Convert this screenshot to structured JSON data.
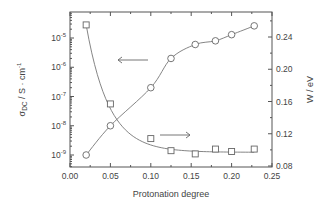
{
  "chart_data": {
    "type": "scatter",
    "title": "",
    "xlabel": "Protonation degree",
    "ylabel_left": "σDC / S · cm⁻¹",
    "ylabel_right": "W / eV",
    "xlim": [
      0.0,
      0.25
    ],
    "ylim_left_log10": [
      -9.5,
      0.8
    ],
    "ylim_right": [
      0.08,
      0.275
    ],
    "x_ticks": [
      "0.00",
      "0.05",
      "0.10",
      "0.15",
      "0.20",
      "0.25"
    ],
    "y_left_ticks": [
      "10-9",
      "10-8",
      "10-7",
      "10-6",
      "10-5"
    ],
    "y_right_ticks": [
      "0.08",
      "0.12",
      "0.16",
      "0.20",
      "0.24"
    ],
    "grid": false,
    "series": [
      {
        "name": "σDC (left axis, log scale)",
        "marker": "circle",
        "axis": "left",
        "x": [
          0.02,
          0.05,
          0.1,
          0.125,
          0.155,
          0.18,
          0.2,
          0.228
        ],
        "values": [
          1e-09,
          1e-08,
          2e-07,
          2e-06,
          6e-06,
          8e-06,
          1.3e-05,
          2.6e-05
        ]
      },
      {
        "name": "W (right axis)",
        "marker": "square",
        "axis": "right",
        "x": [
          0.02,
          0.05,
          0.1,
          0.125,
          0.155,
          0.18,
          0.2,
          0.228
        ],
        "values": [
          0.255,
          0.157,
          0.114,
          0.099,
          0.095,
          0.101,
          0.098,
          0.101
        ]
      }
    ],
    "annotations": [
      {
        "type": "arrow",
        "direction": "left",
        "meaning": "circles → left axis"
      },
      {
        "type": "arrow",
        "direction": "right",
        "meaning": "squares → right axis"
      }
    ]
  },
  "labels": {
    "xlabel": "Protonation degree",
    "ylabel_right": "W / eV"
  }
}
